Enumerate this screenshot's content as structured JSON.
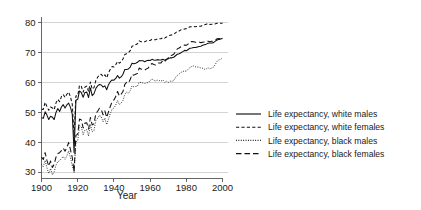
{
  "chart_data": {
    "type": "line",
    "title": "",
    "xlabel": "Year",
    "ylabel": "",
    "xlim": [
      1900,
      2003
    ],
    "ylim": [
      28,
      82
    ],
    "grid": true,
    "legend_position": "right",
    "yticks": [
      30,
      40,
      50,
      60,
      70,
      80
    ],
    "ytick_labels": [
      "30",
      "40",
      "50",
      "60",
      "70",
      "80"
    ],
    "xticks": [
      1900,
      1920,
      1940,
      1960,
      1980,
      2000
    ],
    "xtick_labels": [
      "1900",
      "1920",
      "1940",
      "1960",
      "1980",
      "2000"
    ],
    "series": [
      {
        "name": "Life expectancy, white males",
        "style": "solid",
        "x": [
          1900,
          1901,
          1902,
          1903,
          1904,
          1905,
          1906,
          1907,
          1908,
          1909,
          1910,
          1911,
          1912,
          1913,
          1914,
          1915,
          1916,
          1917,
          1918,
          1919,
          1920,
          1921,
          1922,
          1923,
          1924,
          1925,
          1926,
          1927,
          1928,
          1929,
          1930,
          1931,
          1932,
          1933,
          1934,
          1935,
          1936,
          1937,
          1938,
          1939,
          1940,
          1941,
          1942,
          1943,
          1944,
          1945,
          1946,
          1947,
          1948,
          1949,
          1950,
          1951,
          1952,
          1953,
          1954,
          1955,
          1956,
          1957,
          1958,
          1959,
          1960,
          1961,
          1962,
          1963,
          1964,
          1965,
          1966,
          1967,
          1968,
          1969,
          1970,
          1971,
          1972,
          1973,
          1974,
          1975,
          1976,
          1977,
          1978,
          1979,
          1980,
          1981,
          1982,
          1983,
          1984,
          1985,
          1986,
          1987,
          1988,
          1989,
          1990,
          1991,
          1992,
          1993,
          1994,
          1995,
          1996,
          1997,
          1998,
          1999,
          2000
        ],
        "y": [
          48.2,
          48.0,
          50.2,
          49.1,
          47.6,
          48.7,
          48.4,
          47.6,
          50.0,
          51.3,
          50.3,
          51.8,
          52.6,
          51.5,
          52.5,
          53.1,
          51.7,
          49.4,
          36.6,
          54.1,
          54.4,
          57.2,
          56.6,
          55.1,
          56.7,
          56.8,
          55.0,
          58.2,
          55.6,
          56.3,
          58.0,
          58.9,
          59.4,
          59.2,
          58.5,
          58.9,
          57.6,
          59.3,
          60.3,
          60.9,
          60.8,
          61.4,
          62.4,
          61.5,
          61.9,
          62.8,
          64.4,
          64.4,
          64.6,
          65.2,
          66.5,
          66.3,
          66.5,
          66.8,
          67.4,
          67.3,
          67.3,
          67.0,
          67.3,
          67.5,
          67.4,
          67.8,
          67.6,
          67.5,
          67.7,
          67.6,
          67.6,
          67.8,
          67.5,
          67.8,
          68.0,
          68.3,
          68.3,
          68.5,
          69.0,
          69.5,
          69.7,
          70.0,
          70.4,
          70.8,
          70.7,
          71.1,
          71.5,
          71.6,
          71.8,
          71.8,
          71.9,
          72.1,
          72.2,
          72.5,
          72.7,
          72.9,
          73.2,
          73.3,
          73.3,
          73.4,
          73.9,
          74.3,
          74.5,
          74.6,
          74.9
        ]
      },
      {
        "name": "Life expectancy, white females",
        "style": "dashed",
        "x": [
          1900,
          1901,
          1902,
          1903,
          1904,
          1905,
          1906,
          1907,
          1908,
          1909,
          1910,
          1911,
          1912,
          1913,
          1914,
          1915,
          1916,
          1917,
          1918,
          1919,
          1920,
          1921,
          1922,
          1923,
          1924,
          1925,
          1926,
          1927,
          1928,
          1929,
          1930,
          1931,
          1932,
          1933,
          1934,
          1935,
          1936,
          1937,
          1938,
          1939,
          1940,
          1941,
          1942,
          1943,
          1944,
          1945,
          1946,
          1947,
          1948,
          1949,
          1950,
          1951,
          1952,
          1953,
          1954,
          1955,
          1956,
          1957,
          1958,
          1959,
          1960,
          1961,
          1962,
          1963,
          1964,
          1965,
          1966,
          1967,
          1968,
          1969,
          1970,
          1971,
          1972,
          1973,
          1974,
          1975,
          1976,
          1977,
          1978,
          1979,
          1980,
          1981,
          1982,
          1983,
          1984,
          1985,
          1986,
          1987,
          1988,
          1989,
          1990,
          1991,
          1992,
          1993,
          1994,
          1995,
          1996,
          1997,
          1998,
          1999,
          2000
        ],
        "y": [
          51.1,
          51.0,
          53.4,
          52.0,
          50.7,
          51.8,
          51.5,
          50.9,
          53.2,
          54.4,
          53.6,
          55.3,
          56.0,
          55.0,
          56.1,
          56.8,
          55.2,
          52.7,
          42.2,
          55.5,
          55.6,
          59.1,
          58.7,
          56.8,
          58.5,
          58.8,
          57.0,
          60.2,
          57.8,
          58.3,
          60.7,
          61.8,
          62.6,
          62.8,
          62.0,
          62.6,
          61.6,
          63.3,
          64.5,
          65.4,
          65.2,
          66.0,
          67.1,
          66.5,
          67.0,
          67.9,
          69.4,
          69.7,
          70.0,
          70.7,
          72.2,
          72.4,
          72.7,
          73.0,
          74.0,
          73.7,
          73.7,
          73.7,
          74.0,
          74.2,
          74.1,
          74.5,
          74.4,
          74.4,
          74.6,
          74.7,
          74.7,
          75.1,
          74.9,
          75.3,
          75.6,
          75.9,
          76.0,
          76.2,
          76.7,
          77.2,
          77.3,
          77.7,
          77.8,
          78.0,
          78.1,
          78.4,
          78.7,
          78.7,
          78.8,
          78.7,
          78.8,
          78.9,
          78.9,
          79.2,
          79.4,
          79.6,
          79.8,
          79.5,
          79.6,
          79.6,
          79.7,
          79.9,
          79.9,
          79.9,
          79.9
        ]
      },
      {
        "name": "Life expectancy, black males",
        "style": "dotted",
        "x": [
          1900,
          1901,
          1902,
          1903,
          1904,
          1905,
          1906,
          1907,
          1908,
          1909,
          1910,
          1911,
          1912,
          1913,
          1914,
          1915,
          1916,
          1917,
          1918,
          1919,
          1920,
          1921,
          1922,
          1923,
          1924,
          1925,
          1926,
          1927,
          1928,
          1929,
          1930,
          1931,
          1932,
          1933,
          1934,
          1935,
          1936,
          1937,
          1938,
          1939,
          1940,
          1941,
          1942,
          1943,
          1944,
          1945,
          1946,
          1947,
          1948,
          1949,
          1950,
          1951,
          1952,
          1953,
          1954,
          1955,
          1956,
          1957,
          1958,
          1959,
          1960,
          1961,
          1962,
          1963,
          1964,
          1965,
          1966,
          1967,
          1968,
          1969,
          1970,
          1971,
          1972,
          1973,
          1974,
          1975,
          1976,
          1977,
          1978,
          1979,
          1980,
          1981,
          1982,
          1983,
          1984,
          1985,
          1986,
          1987,
          1988,
          1989,
          1990,
          1991,
          1992,
          1993,
          1994,
          1995,
          1996,
          1997,
          1998,
          1999,
          2000
        ],
        "y": [
          32.5,
          31.8,
          33.9,
          31.4,
          29.5,
          31.2,
          29.0,
          30.1,
          32.3,
          33.5,
          33.8,
          34.5,
          35.2,
          34.3,
          35.4,
          37.1,
          34.8,
          32.1,
          29.9,
          40.1,
          40.5,
          45.5,
          45.2,
          42.5,
          44.1,
          44.2,
          42.1,
          46.0,
          43.5,
          43.9,
          47.3,
          48.0,
          49.0,
          48.6,
          46.8,
          48.1,
          45.9,
          47.8,
          49.6,
          51.1,
          51.5,
          52.5,
          54.0,
          52.6,
          53.1,
          54.0,
          56.1,
          56.8,
          56.4,
          57.3,
          58.9,
          58.6,
          58.7,
          58.8,
          60.2,
          60.0,
          59.9,
          59.7,
          59.9,
          60.0,
          60.7,
          61.2,
          60.8,
          60.5,
          60.8,
          60.7,
          60.5,
          60.9,
          60.1,
          60.5,
          60.0,
          60.5,
          60.4,
          60.7,
          61.7,
          62.4,
          62.9,
          63.4,
          63.7,
          63.9,
          63.8,
          64.5,
          65.1,
          65.4,
          65.6,
          65.3,
          65.2,
          65.2,
          64.9,
          64.8,
          64.5,
          64.6,
          65.0,
          64.6,
          64.9,
          65.2,
          66.1,
          67.2,
          67.6,
          67.8,
          68.3
        ]
      },
      {
        "name": "Life expectancy, black females",
        "style": "dashdash",
        "x": [
          1900,
          1901,
          1902,
          1903,
          1904,
          1905,
          1906,
          1907,
          1908,
          1909,
          1910,
          1911,
          1912,
          1913,
          1914,
          1915,
          1916,
          1917,
          1918,
          1919,
          1920,
          1921,
          1922,
          1923,
          1924,
          1925,
          1926,
          1927,
          1928,
          1929,
          1930,
          1931,
          1932,
          1933,
          1934,
          1935,
          1936,
          1937,
          1938,
          1939,
          1940,
          1941,
          1942,
          1943,
          1944,
          1945,
          1946,
          1947,
          1948,
          1949,
          1950,
          1951,
          1952,
          1953,
          1954,
          1955,
          1956,
          1957,
          1958,
          1959,
          1960,
          1961,
          1962,
          1963,
          1964,
          1965,
          1966,
          1967,
          1968,
          1969,
          1970,
          1971,
          1972,
          1973,
          1974,
          1975,
          1976,
          1977,
          1978,
          1979,
          1980,
          1981,
          1982,
          1983,
          1984,
          1985,
          1986,
          1987,
          1988,
          1989,
          1990,
          1991,
          1992,
          1993,
          1994,
          1995,
          1996,
          1997,
          1998,
          1999,
          2000
        ],
        "y": [
          35.0,
          34.2,
          36.5,
          33.9,
          32.0,
          33.7,
          31.5,
          32.6,
          35.0,
          36.2,
          36.5,
          37.2,
          38.0,
          37.0,
          38.2,
          39.9,
          37.5,
          34.8,
          30.1,
          42.3,
          42.7,
          47.8,
          47.5,
          44.8,
          46.4,
          46.5,
          44.4,
          48.3,
          45.8,
          46.2,
          49.6,
          50.4,
          51.4,
          51.0,
          49.2,
          50.5,
          48.3,
          50.2,
          52.0,
          53.6,
          54.2,
          55.3,
          57.0,
          55.5,
          56.1,
          57.0,
          59.4,
          60.1,
          59.9,
          61.0,
          62.7,
          62.5,
          62.8,
          63.1,
          64.9,
          64.5,
          64.4,
          64.2,
          64.6,
          64.9,
          65.9,
          66.4,
          66.1,
          65.9,
          66.5,
          66.6,
          66.6,
          67.4,
          67.0,
          67.7,
          68.3,
          69.0,
          69.2,
          69.5,
          70.3,
          71.3,
          71.6,
          72.0,
          72.4,
          72.6,
          72.5,
          73.0,
          73.6,
          73.8,
          73.7,
          73.5,
          73.5,
          73.6,
          73.4,
          73.5,
          73.6,
          73.8,
          73.9,
          73.7,
          73.9,
          73.9,
          74.2,
          74.7,
          74.8,
          74.7,
          75.1
        ]
      }
    ],
    "legend_entries": [
      {
        "label": "Life expectancy, white males",
        "style": "solid"
      },
      {
        "label": "Life expectancy, white females",
        "style": "dashed"
      },
      {
        "label": "Life expectancy, black males",
        "style": "dotted"
      },
      {
        "label": "Life expectancy, black females",
        "style": "dashdash"
      }
    ],
    "colors": {
      "line": "#111111",
      "grid": "#cfcfcf",
      "axis": "#555555",
      "background": "#ffffff"
    }
  }
}
